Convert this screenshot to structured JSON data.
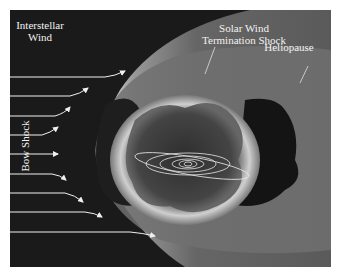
{
  "diagram": {
    "labels": {
      "interstellar_wind_line1": "Interstellar",
      "interstellar_wind_line2": "Wind",
      "termination_shock_line1": "Solar Wind",
      "termination_shock_line2": "Termination Shock",
      "heliopause": "Heliopause",
      "bow_shock": "Bow Shock"
    },
    "wind_arrow_count": 9,
    "colors": {
      "background": "#1a1a1a",
      "bow_shock_region": "#5a5a5a",
      "heliopause_region": "#6e6e6e",
      "termination_shell": "#b8b8b8",
      "inner_heliosphere": "#3a3a3a",
      "heliotail": "#151515",
      "orbits": "#e8e8e8",
      "arrows": "#f0f0f0",
      "border": "#ffffff"
    }
  }
}
